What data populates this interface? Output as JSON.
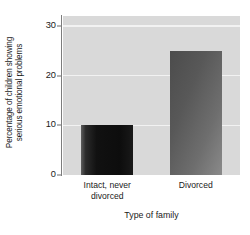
{
  "chart_data": {
    "type": "bar",
    "title": "",
    "categories": [
      "Intact, never\ndivorced",
      "Divorced"
    ],
    "values": [
      10,
      25
    ],
    "xlabel": "Type of family",
    "ylabel": "Percentage of children showing\nserious emotional problems",
    "ylim": [
      0,
      32
    ],
    "yticks": [
      0,
      10,
      20,
      30
    ],
    "ytick_labels": [
      "0",
      "10",
      "20",
      "30"
    ],
    "grid": true,
    "gridlines_at": [
      10,
      20,
      30
    ],
    "legend": null,
    "series": [
      {
        "name": "Percentage of children showing serious emotional problems",
        "values": [
          10,
          25
        ]
      }
    ],
    "colors": {
      "bar_intact": "#111111",
      "bar_divorced": "#6e6e6e",
      "plot_background": "#d9d9d9",
      "gridline": "#f2f2f2",
      "axis_line": "#7d7d7d",
      "text": "#1a1a1a",
      "figure_background": "#ffffff"
    }
  }
}
